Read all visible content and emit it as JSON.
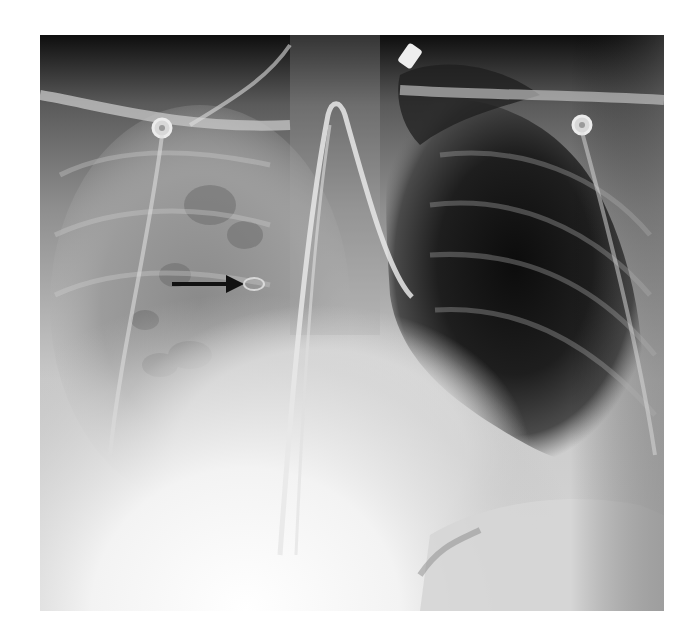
{
  "figure": {
    "type": "chest radiograph (AP view)",
    "annotations": [
      {
        "kind": "arrow",
        "direction": "right",
        "color": "#111111",
        "x1": 172,
        "y1": 284,
        "x2": 242,
        "y2": 284
      }
    ],
    "features": [
      "endotracheal / nasogastric tube looping in mediastinum",
      "hyperlucent left hemithorax",
      "opacified right lung field",
      "ECG electrode leads over shoulders"
    ],
    "colors": {
      "background": "#ffffff",
      "arrow": "#111111",
      "dark_lung": "#1a1a1a",
      "soft_tissue": "#bdbdbd",
      "bright": "#f8f8f8"
    }
  }
}
